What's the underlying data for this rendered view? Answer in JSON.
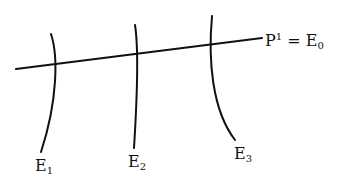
{
  "diagram": {
    "labels": {
      "main_line": {
        "base": "P",
        "sup": "1",
        "eq": " = ",
        "rhs_base": "E",
        "rhs_sub": "0"
      },
      "curves": [
        {
          "base": "E",
          "sub": "1"
        },
        {
          "base": "E",
          "sub": "2"
        },
        {
          "base": "E",
          "sub": "3"
        }
      ]
    },
    "stroke_color": "#111111",
    "background": "#ffffff"
  }
}
